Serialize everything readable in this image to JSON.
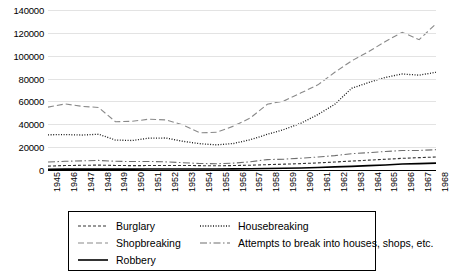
{
  "chart_data": {
    "type": "line",
    "title": "",
    "subtitle": "",
    "xlabel": "",
    "ylabel": "",
    "grid": true,
    "legend_position": "bottom",
    "xlim": [
      1945,
      1968
    ],
    "ylim": [
      0,
      140000
    ],
    "ytick_labels": [
      "0",
      "20000",
      "40000",
      "60000",
      "80000",
      "100000",
      "120000",
      "140000"
    ],
    "ytick_values": [
      0,
      20000,
      40000,
      60000,
      80000,
      100000,
      120000,
      140000
    ],
    "categories": [
      "1945",
      "1946",
      "1947",
      "1948",
      "1949",
      "1950",
      "1951",
      "1952",
      "1953",
      "1954",
      "1955",
      "1956",
      "1957",
      "1958",
      "1959",
      "1960",
      "1961",
      "1962",
      "1963",
      "1964",
      "1965",
      "1966",
      "1967",
      "1968"
    ],
    "x": [
      1945,
      1946,
      1947,
      1948,
      1949,
      1950,
      1951,
      1952,
      1953,
      1954,
      1955,
      1956,
      1957,
      1958,
      1959,
      1960,
      1961,
      1962,
      1963,
      1964,
      1965,
      1966,
      1967,
      1968
    ],
    "series": [
      {
        "name": "Burglary",
        "style": "dashed",
        "color": "#333333",
        "values": [
          3400,
          3900,
          4100,
          4300,
          4000,
          3800,
          3900,
          4000,
          4000,
          3800,
          3700,
          3900,
          4200,
          4700,
          5100,
          5600,
          6200,
          7000,
          7800,
          8600,
          9400,
          10200,
          10800,
          11400
        ]
      },
      {
        "name": "Housebreaking",
        "style": "dotted",
        "color": "#1a1a1a",
        "values": [
          30800,
          31000,
          30600,
          31300,
          26200,
          25800,
          27900,
          28000,
          25100,
          23000,
          22000,
          23200,
          26500,
          31200,
          35500,
          41000,
          48500,
          57500,
          71500,
          76500,
          81000,
          84000,
          83000,
          85500
        ]
      },
      {
        "name": "Shopbreaking",
        "style": "longdash",
        "color": "#8a8a8a",
        "values": [
          55000,
          57800,
          55700,
          54700,
          42200,
          42600,
          44500,
          43800,
          39500,
          32500,
          33000,
          38400,
          45600,
          57500,
          60500,
          67500,
          74500,
          85500,
          95500,
          103500,
          112500,
          120500,
          114000,
          128000
        ]
      },
      {
        "name": "Attempts to break into houses, shops, etc.",
        "style": "dashdot",
        "color": "#6e6e6e",
        "values": [
          7000,
          7600,
          8000,
          8400,
          7600,
          7400,
          7500,
          7100,
          6400,
          5700,
          5500,
          6000,
          7200,
          9100,
          9500,
          10300,
          11400,
          12600,
          14300,
          15200,
          16200,
          17000,
          17100,
          17800
        ]
      },
      {
        "name": "Robbery",
        "style": "solid",
        "color": "#000000",
        "values": [
          700,
          800,
          800,
          800,
          800,
          800,
          900,
          900,
          900,
          900,
          900,
          1000,
          1100,
          1300,
          1500,
          1800,
          2200,
          2700,
          3200,
          3800,
          4400,
          5200,
          5600,
          6000
        ]
      }
    ]
  },
  "legend": {
    "rows": [
      [
        {
          "label": "Burglary",
          "style": "dashed"
        },
        {
          "label": "Housebreaking",
          "style": "dotted"
        }
      ],
      [
        {
          "label": "Shopbreaking",
          "style": "longdash"
        },
        {
          "label": "Attempts to break into houses, shops, etc.",
          "style": "dashdot"
        }
      ],
      [
        {
          "label": "Robbery",
          "style": "solid"
        }
      ]
    ]
  }
}
